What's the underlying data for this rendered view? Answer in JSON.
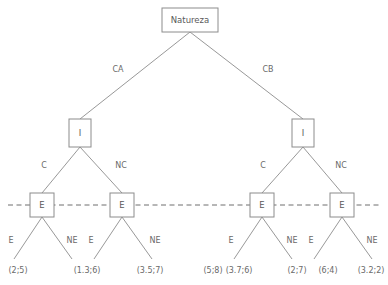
{
  "diagram": {
    "type": "extensive-form-game-tree",
    "colors": {
      "background": "#ffffff",
      "edge": "#8c8c8c",
      "node_stroke": "#8c8c8c",
      "node_fill": "#ffffff",
      "text": "#5a5a5a",
      "infoset_dash": "#6e6e6e"
    }
  },
  "root": {
    "label": "Natureza",
    "box": {
      "x": 162,
      "y": 8,
      "w": 56,
      "h": 24
    }
  },
  "chance_edges": [
    {
      "label": "CA",
      "x": 118,
      "y": 69
    },
    {
      "label": "CB",
      "x": 268,
      "y": 69
    }
  ],
  "decision_nodes": [
    {
      "label": "I",
      "cx": 80,
      "cy": 133,
      "w": 22,
      "h": 28
    },
    {
      "label": "I",
      "cx": 303,
      "cy": 133,
      "w": 22,
      "h": 28
    }
  ],
  "player_edges": [
    {
      "label": "C",
      "x": 44,
      "y": 165
    },
    {
      "label": "NC",
      "x": 121,
      "y": 165
    },
    {
      "label": "C",
      "x": 263,
      "y": 165
    },
    {
      "label": "NC",
      "x": 341,
      "y": 165
    }
  ],
  "infoset_nodes": [
    {
      "label": "E",
      "cx": 42,
      "cy": 205,
      "w": 24,
      "h": 24
    },
    {
      "label": "E",
      "cx": 122,
      "cy": 205,
      "w": 24,
      "h": 24
    },
    {
      "label": "E",
      "cx": 262,
      "cy": 205,
      "w": 24,
      "h": 24
    },
    {
      "label": "E",
      "cx": 342,
      "cy": 205,
      "w": 24,
      "h": 24
    }
  ],
  "infoset_line": {
    "x1": 8,
    "x2": 380,
    "y": 205
  },
  "terminal_edges": [
    {
      "label": "E",
      "x": 11,
      "y": 240
    },
    {
      "label": "NE",
      "x": 72,
      "y": 240
    },
    {
      "label": "E",
      "x": 91,
      "y": 240
    },
    {
      "label": "NE",
      "x": 155,
      "y": 240
    },
    {
      "label": "E",
      "x": 231,
      "y": 240
    },
    {
      "label": "NE",
      "x": 292,
      "y": 240
    },
    {
      "label": "E",
      "x": 311,
      "y": 240
    },
    {
      "label": "NE",
      "x": 372,
      "y": 240
    }
  ],
  "payoffs": [
    {
      "label": "(2;5)",
      "x": 18,
      "y": 270
    },
    {
      "label": "(1.3;6)",
      "x": 87,
      "y": 270
    },
    {
      "label": "(3.5;7)",
      "x": 150,
      "y": 270
    },
    {
      "label": "(5;8)",
      "x": 213,
      "y": 270
    },
    {
      "label": "(3.7;6)",
      "x": 239,
      "y": 270
    },
    {
      "label": "(2;7)",
      "x": 297,
      "y": 270
    },
    {
      "label": "(6;4)",
      "x": 328,
      "y": 270
    },
    {
      "label": "(3.2;2)",
      "x": 371,
      "y": 270
    }
  ],
  "edges": [
    {
      "name": "root-to-left-I",
      "x1": 190,
      "y1": 32,
      "x2": 80,
      "y2": 119
    },
    {
      "name": "root-to-right-I",
      "x1": 190,
      "y1": 32,
      "x2": 303,
      "y2": 119
    },
    {
      "name": "left-I-to-E1",
      "x1": 80,
      "y1": 147,
      "x2": 42,
      "y2": 193
    },
    {
      "name": "left-I-to-E2",
      "x1": 80,
      "y1": 147,
      "x2": 122,
      "y2": 193
    },
    {
      "name": "right-I-to-E3",
      "x1": 303,
      "y1": 147,
      "x2": 262,
      "y2": 193
    },
    {
      "name": "right-I-to-E4",
      "x1": 303,
      "y1": 147,
      "x2": 342,
      "y2": 193
    },
    {
      "name": "E1-to-payoff1",
      "x1": 42,
      "y1": 217,
      "x2": 14,
      "y2": 259
    },
    {
      "name": "E1-to-payoff2",
      "x1": 42,
      "y1": 217,
      "x2": 72,
      "y2": 259
    },
    {
      "name": "E2-to-payoff3",
      "x1": 122,
      "y1": 217,
      "x2": 94,
      "y2": 259
    },
    {
      "name": "E2-to-payoff4",
      "x1": 122,
      "y1": 217,
      "x2": 152,
      "y2": 259
    },
    {
      "name": "E3-to-payoff5",
      "x1": 262,
      "y1": 217,
      "x2": 234,
      "y2": 259
    },
    {
      "name": "E3-to-payoff6",
      "x1": 262,
      "y1": 217,
      "x2": 292,
      "y2": 259
    },
    {
      "name": "E4-to-payoff7",
      "x1": 342,
      "y1": 217,
      "x2": 314,
      "y2": 259
    },
    {
      "name": "E4-to-payoff8",
      "x1": 342,
      "y1": 217,
      "x2": 372,
      "y2": 259
    }
  ]
}
